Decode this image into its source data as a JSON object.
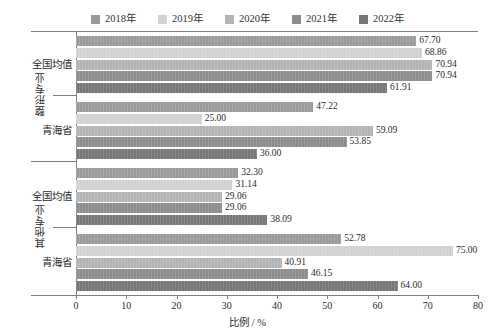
{
  "chart_data": {
    "type": "bar",
    "orientation": "horizontal",
    "title": "",
    "xlabel": "比例 / %",
    "ylabel": "",
    "xlim": [
      0,
      80
    ],
    "xticks": [
      0,
      10,
      20,
      30,
      40,
      50,
      60,
      70,
      80
    ],
    "grid": false,
    "legend_position": "top-center",
    "legend": [
      "2018年",
      "2019年",
      "2020年",
      "2021年",
      "2022年"
    ],
    "series": [
      {
        "name": "2018年",
        "color": "#9a9a9a",
        "values": [
          67.7,
          47.22,
          32.3,
          52.78
        ]
      },
      {
        "name": "2019年",
        "color": "#d2d2d2",
        "values": [
          68.86,
          25.0,
          31.14,
          75.0
        ]
      },
      {
        "name": "2020年",
        "color": "#b4b4b4",
        "values": [
          70.94,
          59.09,
          29.06,
          40.91
        ]
      },
      {
        "name": "2021年",
        "color": "#8c8c8c",
        "values": [
          70.94,
          53.85,
          29.06,
          46.15
        ]
      },
      {
        "name": "2022年",
        "color": "#777777",
        "values": [
          61.91,
          36.0,
          38.09,
          64.0
        ]
      }
    ],
    "categories": [
      "全国均值",
      "青海省",
      "全国均值",
      "青海省"
    ],
    "category_groups": [
      {
        "label": "整形专业",
        "categories": [
          "全国均值",
          "青海省"
        ]
      },
      {
        "label": "其他专业",
        "categories": [
          "全国均值",
          "青海省"
        ]
      }
    ],
    "data_labels": [
      [
        "67.70",
        "68.86",
        "70.94",
        "70.94",
        "61.91"
      ],
      [
        "47.22",
        "25.00",
        "59.09",
        "53.85",
        "36.00"
      ],
      [
        "32.30",
        "31.14",
        "29.06",
        "29.06",
        "38.09"
      ],
      [
        "52.78",
        "75.00",
        "40.91",
        "46.15",
        "64.00"
      ]
    ]
  }
}
